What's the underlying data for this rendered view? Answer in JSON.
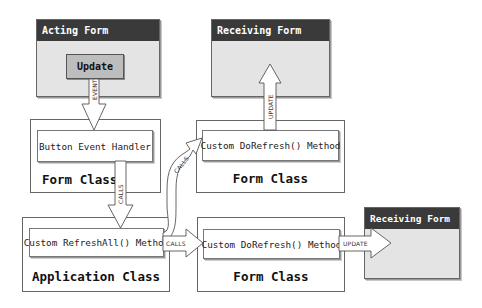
{
  "acting_form": {
    "title": "Acting Form",
    "button_label": "Update"
  },
  "receiving_form_top": {
    "title": "Receiving Form"
  },
  "receiving_form_right": {
    "title": "Receiving Form"
  },
  "form_class_left": {
    "label": "Form Class",
    "method": "Button Event Handler"
  },
  "form_class_top_right": {
    "label": "Form Class",
    "method": "Custom DoRefresh() Method"
  },
  "application_class": {
    "label": "Application Class",
    "method": "Custom RefreshAll() Method"
  },
  "form_class_bottom_right": {
    "label": "Form Class",
    "method": "Custom DoRefresh() Method"
  },
  "arrows": {
    "event": "EVENT",
    "calls_down": "CALLS",
    "calls_curved": "CALLS",
    "calls_right": "CALLS",
    "update_up": "UPDATE",
    "update_right": "UPDATE"
  },
  "colors": {
    "title_bar": "#3a3a3a",
    "form_body": "#e4e4e4",
    "button": "#bdbdbd",
    "border": "#666666"
  }
}
